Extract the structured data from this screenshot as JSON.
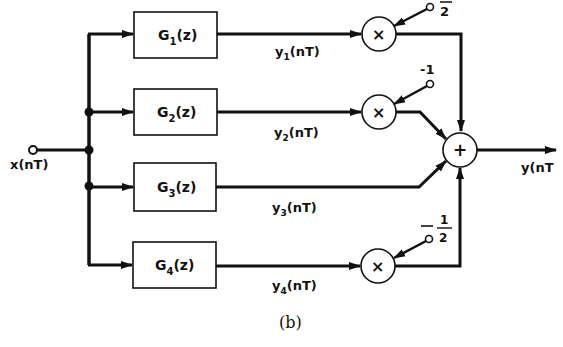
{
  "figure": {
    "caption": "(b)",
    "type": "block-diagram"
  },
  "input": {
    "label": "x(nT)"
  },
  "output": {
    "label": "y(nT"
  },
  "branches": [
    {
      "block": "G",
      "sub": "1",
      "arg": "(z)",
      "signal": "y",
      "signal_sub": "1",
      "signal_arg": "(nT)",
      "gain": "2",
      "gain_display": "fraction-bar-over-2"
    },
    {
      "block": "G",
      "sub": "2",
      "arg": "(z)",
      "signal": "y",
      "signal_sub": "2",
      "signal_arg": "(nT)",
      "gain": "-1"
    },
    {
      "block": "G",
      "sub": "3",
      "arg": "(z)",
      "signal": "y",
      "signal_sub": "3",
      "signal_arg": "(nT)",
      "gain": null
    },
    {
      "block": "G",
      "sub": "4",
      "arg": "(z)",
      "signal": "y",
      "signal_sub": "4",
      "signal_arg": "(nT)",
      "gain_num": "1",
      "gain_den": "2",
      "gain_sign": "-"
    }
  ],
  "symbols": {
    "multiplier": "×",
    "summer": "+"
  },
  "colors": {
    "ink": "#111111",
    "background": "#ffffff"
  }
}
